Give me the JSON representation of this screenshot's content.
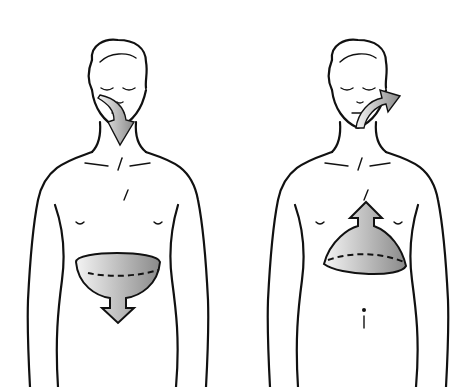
{
  "diagram": {
    "type": "illustration",
    "panels": [
      {
        "id": "inhale",
        "description": "Air flows in through nose/mouth (downward arrow); diaphragm moves down (bowl shape with downward arrow)",
        "airflow_direction": "in",
        "diaphragm_direction": "down"
      },
      {
        "id": "exhale",
        "description": "Air flows out through mouth (upward-right arrow); diaphragm moves up (dome shape with upward arrow)",
        "airflow_direction": "out",
        "diaphragm_direction": "up"
      }
    ],
    "colors": {
      "ink": "#111111",
      "background": "#ffffff",
      "arrow_fill_light": "#f2f2f2",
      "arrow_fill_dark": "#8a8a8a"
    }
  }
}
